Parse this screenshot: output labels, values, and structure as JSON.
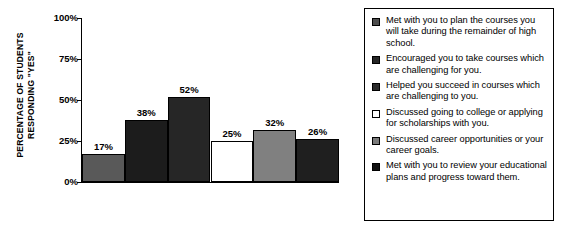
{
  "chart_data": {
    "type": "bar",
    "title": "",
    "xlabel": "",
    "ylabel": "PERCENTAGE OF STUDENTS RESPONDING \"YES\"",
    "ylabel_lines": [
      "PERCENTAGE OF STUDENTS",
      "RESPONDING \"YES\""
    ],
    "ylim": [
      0,
      100
    ],
    "ytick_labels": [
      "100%",
      "75%",
      "50%",
      "25%",
      "0%"
    ],
    "ytick_values": [
      100,
      75,
      50,
      25,
      0
    ],
    "grid": false,
    "legend_position": "right",
    "categories": [
      "Met with you to plan the courses you will take during the remainder of high school.",
      "Encouraged you to take courses which are challenging for you.",
      "Helped you succeed in courses which are challenging to you.",
      "Discussed going to college or applying for scholarships with you.",
      "Discussed career opportunities or your career goals.",
      "Met with you to review your educational plans and progress toward them."
    ],
    "values": [
      17,
      38,
      52,
      25,
      32,
      26
    ],
    "value_labels": [
      "17%",
      "38%",
      "52%",
      "25%",
      "32%",
      "26%"
    ],
    "bar_colors": [
      "#595959",
      "#1c1c1c",
      "#262626",
      "#ffffff",
      "#808080",
      "#1f1f1f"
    ]
  },
  "legend": {
    "items": [
      {
        "label": "Met with you to plan the courses you will take during the remainder of high school.",
        "swatch_color": "#4d4d4d"
      },
      {
        "label": "Encouraged you to take courses which are challenging for you.",
        "swatch_color": "#262626"
      },
      {
        "label": "Helped you succeed in courses which are challenging to you.",
        "swatch_color": "#2b2b2b"
      },
      {
        "label": "Discussed going to college or applying for scholarships with you.",
        "swatch_color": "#ffffff"
      },
      {
        "label": "Discussed career opportunities or your career goals.",
        "swatch_color": "#7a7a7a"
      },
      {
        "label": "Met with you to review your educational plans and progress toward them.",
        "swatch_color": "#111111"
      }
    ]
  },
  "colors": {
    "axis": "#000000",
    "text": "#000000",
    "background": "#ffffff",
    "legend_border": "#000000"
  }
}
